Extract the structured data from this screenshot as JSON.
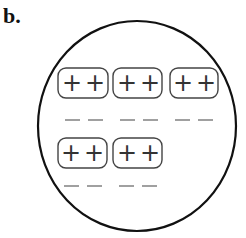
{
  "panel_label": "b.",
  "container": {
    "shape": "circle",
    "stroke": "#111111"
  },
  "paired_groups": [
    {
      "charges": [
        "+",
        "+"
      ],
      "electrons": [
        "−",
        "−"
      ]
    },
    {
      "charges": [
        "+",
        "+"
      ],
      "electrons": [
        "−",
        "−"
      ]
    },
    {
      "charges": [
        "+",
        "+"
      ],
      "electrons": [
        "−",
        "−"
      ]
    },
    {
      "charges": [
        "+",
        "+"
      ],
      "electrons": [
        "−",
        "−"
      ]
    },
    {
      "charges": [
        "+",
        "+"
      ],
      "electrons": [
        "−",
        "−"
      ]
    }
  ],
  "colors": {
    "line": "#111111",
    "box": "#444444",
    "dash": "#777777"
  }
}
